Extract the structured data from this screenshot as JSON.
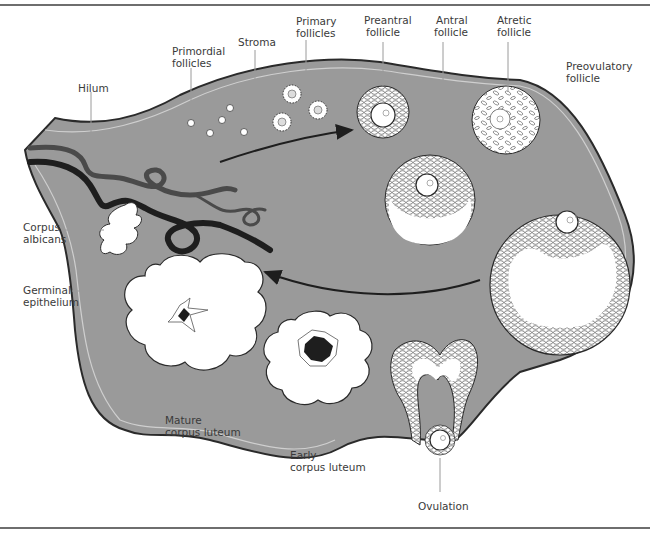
{
  "figure": {
    "colors": {
      "stroma": "#9a9a9a",
      "outline": "#2a2a2a",
      "vessel_dark": "#1e1e1e",
      "vessel_mid": "#4a4a4a",
      "cell_fill": "#ffffff",
      "label_text": "#3a3a3a",
      "leader_line": "#9a9a9a"
    }
  },
  "labels": {
    "hilum": "Hilum",
    "primordial_follicles": [
      "Primordial",
      "follicles"
    ],
    "stroma": "Stroma",
    "primary_follicles": [
      "Primary",
      "follicles"
    ],
    "preantral_follicle": [
      "Preantral",
      "follicle"
    ],
    "antral_follicle": [
      "Antral",
      "follicle"
    ],
    "atretic_follicle": [
      "Atretic",
      "follicle"
    ],
    "preovulatory_follicle": [
      "Preovulatory",
      "follicle"
    ],
    "corpus_albicans": [
      "Corpus",
      "albicans"
    ],
    "germinal_epithelium": [
      "Germinal",
      "epithelium"
    ],
    "mature_corpus_luteum": [
      "Mature",
      "corpus luteum"
    ],
    "early_corpus_luteum": [
      "Early",
      "corpus luteum"
    ],
    "ovulation": "Ovulation"
  },
  "arrows": [
    {
      "name": "development-arrow",
      "direction": "toward follicles (left to right, upper)"
    },
    {
      "name": "regression-arrow",
      "direction": "toward corpus luteum (right to left, lower)"
    }
  ]
}
